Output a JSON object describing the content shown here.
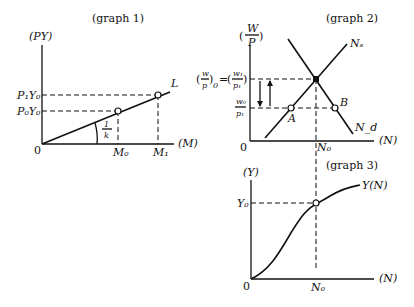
{
  "graph1": {
    "title": "(graph 1)",
    "y_axis_label": "(PY)",
    "x_axis_label": "(M)",
    "origin": "0",
    "line_label": "L",
    "slope_label_num": "1",
    "slope_label_den": "k",
    "y_ticks": [
      "P₁Y₀",
      "P₀Y₀"
    ],
    "x_ticks": [
      "M₀",
      "M₁"
    ]
  },
  "graph2": {
    "title": "(graph 2)",
    "y_axis_label_num": "W",
    "y_axis_label_den": "P",
    "x_axis_label": "(N)",
    "origin": "0",
    "supply_label": "Nₛ",
    "demand_label": "N_d",
    "point_a": "A",
    "point_b": "B",
    "y_tick_upper": "(w/p)₀ = (w₁/p₁)",
    "y_tick_lower_num": "w₀",
    "y_tick_lower_den": "p₁",
    "x_tick": "N₀"
  },
  "graph3": {
    "title": "(graph 3)",
    "y_axis_label": "(Y)",
    "x_axis_label": "(N)",
    "origin": "0",
    "curve_label": "Y(N)",
    "y_tick": "Y₀",
    "x_tick": "N₀"
  }
}
